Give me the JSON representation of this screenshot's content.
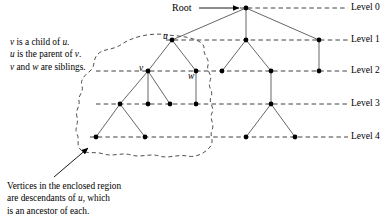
{
  "figure": {
    "root_label": "Root",
    "level_labels": [
      "Level 0",
      "Level 1",
      "Level 2",
      "Level 3",
      "Level 4"
    ],
    "vertex_labels": {
      "u": "u",
      "v": "v",
      "w": "w"
    },
    "note_top": {
      "line1": "v is a child of u.",
      "line2": "u is the parent of v.",
      "line3": "v and w are siblings."
    },
    "note_bottom": {
      "line1": "Vertices in the enclosed region",
      "line2": "are descendants of u, which",
      "line3": "is an ancestor of each."
    },
    "colors": {
      "ink": "#000000",
      "edge": "#4d4d4d",
      "level_line": "#2b2b2b",
      "region_outline": "#3a3a3a",
      "background": "#ffffff"
    }
  },
  "chart_data": {
    "type": "diagram",
    "levels": [
      {
        "name": "Level 0",
        "y": 8
      },
      {
        "name": "Level 1",
        "y": 40
      },
      {
        "name": "Level 2",
        "y": 71
      },
      {
        "name": "Level 3",
        "y": 104
      },
      {
        "name": "Level 4",
        "y": 137
      }
    ],
    "nodes": [
      {
        "id": "root",
        "x": 246,
        "y": 8,
        "level": 0,
        "label": "Root"
      },
      {
        "id": "u",
        "x": 172,
        "y": 40,
        "level": 1,
        "label": "u"
      },
      {
        "id": "m1",
        "x": 246,
        "y": 40,
        "level": 1,
        "label": ""
      },
      {
        "id": "r1",
        "x": 319,
        "y": 40,
        "level": 1,
        "label": ""
      },
      {
        "id": "v",
        "x": 148,
        "y": 71,
        "level": 2,
        "label": "v"
      },
      {
        "id": "w",
        "x": 196,
        "y": 71,
        "level": 2,
        "label": "w"
      },
      {
        "id": "m2a",
        "x": 222,
        "y": 71,
        "level": 2,
        "label": ""
      },
      {
        "id": "m2b",
        "x": 271,
        "y": 71,
        "level": 2,
        "label": ""
      },
      {
        "id": "r2",
        "x": 319,
        "y": 71,
        "level": 2,
        "label": ""
      },
      {
        "id": "l3a",
        "x": 120,
        "y": 104,
        "level": 3,
        "label": ""
      },
      {
        "id": "l3b",
        "x": 148,
        "y": 104,
        "level": 3,
        "label": ""
      },
      {
        "id": "l3c",
        "x": 170,
        "y": 104,
        "level": 3,
        "label": ""
      },
      {
        "id": "l3d",
        "x": 196,
        "y": 104,
        "level": 3,
        "label": ""
      },
      {
        "id": "l3e",
        "x": 271,
        "y": 104,
        "level": 3,
        "label": ""
      },
      {
        "id": "l4a",
        "x": 96,
        "y": 137,
        "level": 4,
        "label": ""
      },
      {
        "id": "l4b",
        "x": 145,
        "y": 137,
        "level": 4,
        "label": ""
      },
      {
        "id": "l4c",
        "x": 246,
        "y": 137,
        "level": 4,
        "label": ""
      },
      {
        "id": "l4d",
        "x": 295,
        "y": 137,
        "level": 4,
        "label": ""
      }
    ],
    "edges": [
      [
        "root",
        "u"
      ],
      [
        "root",
        "m1"
      ],
      [
        "root",
        "r1"
      ],
      [
        "u",
        "v"
      ],
      [
        "u",
        "w"
      ],
      [
        "m1",
        "m2a"
      ],
      [
        "m1",
        "m2b"
      ],
      [
        "r1",
        "r2"
      ],
      [
        "v",
        "l3a"
      ],
      [
        "v",
        "l3b"
      ],
      [
        "v",
        "l3c"
      ],
      [
        "w",
        "l3d"
      ],
      [
        "m2b",
        "l3e"
      ],
      [
        "l3a",
        "l4a"
      ],
      [
        "l3a",
        "l4b"
      ],
      [
        "l3e",
        "l4c"
      ],
      [
        "l3e",
        "l4d"
      ]
    ],
    "region_encloses": [
      "u",
      "v",
      "w",
      "l3a",
      "l3b",
      "l3c",
      "l3d",
      "l4a",
      "l4b"
    ],
    "annotation_arrows": [
      {
        "from": "Root label",
        "x1": 199,
        "y1": 8,
        "x2": 240,
        "y2": 8
      },
      {
        "from": "bottom caption",
        "x1": 55,
        "y1": 176,
        "x2": 88,
        "y2": 148
      }
    ]
  }
}
